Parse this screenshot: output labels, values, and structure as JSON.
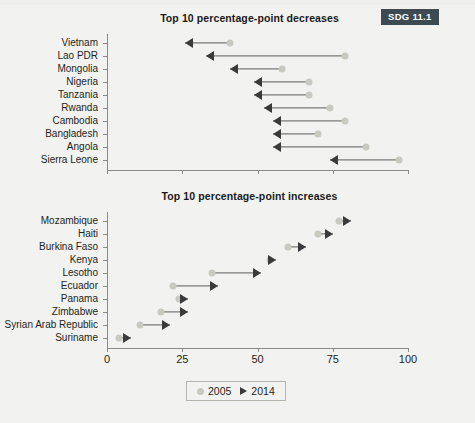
{
  "badge": {
    "label": "SDG 11.1"
  },
  "panels": {
    "top": {
      "title": "Top 10 percentage-point decreases"
    },
    "bottom": {
      "title": "Top 10 percentage-point increases"
    }
  },
  "legend": {
    "items": [
      {
        "label": "2005",
        "marker": "circle-marker",
        "color": "#c9c9c2"
      },
      {
        "label": "2014",
        "marker": "triangle-marker",
        "color": "#3a3a3a"
      }
    ]
  },
  "axis": {
    "ticks": [
      "0",
      "25",
      "50",
      "75",
      "100"
    ],
    "min": 0,
    "max": 100
  },
  "chart_data": [
    {
      "type": "arrow",
      "title": "Top 10 percentage-point decreases",
      "xlabel": "",
      "ylabel": "",
      "xlim": [
        0,
        100
      ],
      "xticks": [
        0,
        25,
        50,
        75,
        100
      ],
      "grid": false,
      "legend_position": "bottom-center",
      "series": [
        {
          "name": "2005",
          "marker": "circle"
        },
        {
          "name": "2014",
          "marker": "triangle"
        }
      ],
      "categories": [
        "Vietnam",
        "Lao PDR",
        "Mongolia",
        "Nigeria",
        "Tanzania",
        "Rwanda",
        "Cambodia",
        "Bangladesh",
        "Angola",
        "Sierra Leone"
      ],
      "start_2005": [
        41,
        79,
        58,
        67,
        67,
        74,
        79,
        70,
        86,
        97
      ],
      "end_2014": [
        26,
        33,
        41,
        49,
        49,
        52,
        55,
        55,
        55,
        74
      ]
    },
    {
      "type": "arrow",
      "title": "Top 10 percentage-point increases",
      "xlabel": "",
      "ylabel": "",
      "xlim": [
        0,
        100
      ],
      "xticks": [
        0,
        25,
        50,
        75,
        100
      ],
      "grid": false,
      "legend_position": "bottom-center",
      "series": [
        {
          "name": "2005",
          "marker": "circle"
        },
        {
          "name": "2014",
          "marker": "triangle"
        }
      ],
      "categories": [
        "Mozambique",
        "Haiti",
        "Burkina Faso",
        "Kenya",
        "Lesotho",
        "Ecuador",
        "Panama",
        "Zimbabwe",
        "Syrian Arab Republic",
        "Suriname"
      ],
      "start_2005": [
        77,
        70,
        60,
        54,
        35,
        22,
        24,
        18,
        11,
        4
      ],
      "end_2014": [
        81,
        75,
        66,
        56,
        51,
        37,
        27,
        27,
        21,
        8
      ]
    }
  ]
}
